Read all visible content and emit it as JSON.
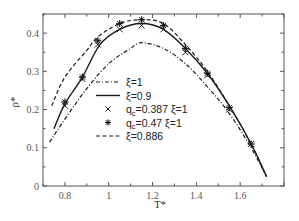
{
  "chart_data": {
    "type": "line",
    "title": "",
    "xlabel": "T*",
    "ylabel": "ρ*",
    "xlim": [
      0.7,
      1.8
    ],
    "ylim": [
      0,
      0.45
    ],
    "xticks": [
      0.8,
      1.0,
      1.2,
      1.4,
      1.6
    ],
    "xtick_labels": [
      "0.8",
      "1",
      "1.2",
      "1.4",
      "1.6"
    ],
    "yticks": [
      0,
      0.1,
      0.2,
      0.3,
      0.4
    ],
    "ytick_labels": [
      "0",
      "0.1",
      "0.2",
      "0.3",
      "0.4"
    ],
    "grid": false,
    "legend_position": "center-left inside",
    "series": [
      {
        "name": "ξ=1",
        "style": "dash-dot",
        "x": [
          0.73,
          0.8,
          0.9,
          1.0,
          1.1,
          1.15,
          1.25,
          1.35,
          1.45,
          1.55,
          1.65,
          1.72
        ],
        "y": [
          0.115,
          0.175,
          0.255,
          0.32,
          0.36,
          0.375,
          0.36,
          0.32,
          0.26,
          0.19,
          0.1,
          0.025
        ]
      },
      {
        "name": "ξ=0.9",
        "style": "solid",
        "x": [
          0.75,
          0.8,
          0.88,
          0.96,
          1.05,
          1.15,
          1.25,
          1.35,
          1.45,
          1.55,
          1.65,
          1.72
        ],
        "y": [
          0.15,
          0.215,
          0.285,
          0.37,
          0.41,
          0.425,
          0.41,
          0.36,
          0.295,
          0.21,
          0.11,
          0.025
        ]
      },
      {
        "name": "q_c=0.387 ξ=1",
        "style": "marker-x",
        "x": [
          0.8,
          0.88,
          0.95,
          1.05,
          1.15,
          1.25,
          1.35,
          1.45,
          1.55,
          1.65
        ],
        "y": [
          0.21,
          0.28,
          0.37,
          0.41,
          0.42,
          0.41,
          0.35,
          0.29,
          0.2,
          0.11
        ]
      },
      {
        "name": "q_c=0.47 ξ=1",
        "style": "marker-asterisk",
        "x": [
          0.8,
          0.88,
          0.95,
          1.05,
          1.15,
          1.25,
          1.35,
          1.45,
          1.55,
          1.65
        ],
        "y": [
          0.22,
          0.285,
          0.38,
          0.425,
          0.435,
          0.42,
          0.36,
          0.295,
          0.205,
          0.11
        ]
      },
      {
        "name": "ξ=0.886",
        "style": "dashed",
        "x": [
          0.74,
          0.8,
          0.9,
          0.95,
          1.05,
          1.15,
          1.25,
          1.35,
          1.45,
          1.55,
          1.65,
          1.72
        ],
        "y": [
          0.21,
          0.285,
          0.355,
          0.39,
          0.425,
          0.435,
          0.425,
          0.37,
          0.3,
          0.21,
          0.11,
          0.025
        ]
      }
    ]
  },
  "legend": {
    "items": [
      {
        "label": "ξ=1",
        "style": "dash-dot"
      },
      {
        "label": "ξ=0.9",
        "style": "solid"
      },
      {
        "label_main": "q",
        "label_sub": "c",
        "label_rest": "=0.387 ξ=1",
        "style": "marker-x"
      },
      {
        "label_main": "q",
        "label_sub": "c",
        "label_rest": "=0.47 ξ=1",
        "style": "marker-asterisk"
      },
      {
        "label": "ξ=0.886",
        "style": "dashed"
      }
    ]
  },
  "colors": {
    "line": "#1a1a1a",
    "frame": "#555555",
    "background": "#ffffff"
  }
}
